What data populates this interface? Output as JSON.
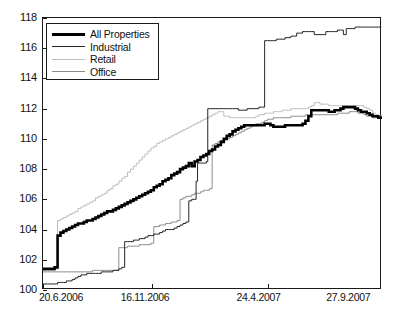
{
  "chart_data": {
    "type": "line",
    "title": "",
    "xlabel": "",
    "ylabel": "",
    "xlim": [
      0,
      465
    ],
    "ylim": [
      100,
      118
    ],
    "grid": false,
    "legend_position": "top-left",
    "y_ticks": [
      100,
      102,
      104,
      106,
      108,
      110,
      112,
      114,
      116,
      118
    ],
    "y_tick_labels": [
      "100",
      "102",
      "104",
      "106",
      "108",
      "110",
      "112",
      "114",
      "116",
      "118"
    ],
    "x_ticks": [
      0,
      149,
      308,
      464
    ],
    "x_tick_labels": [
      "20.6.2006",
      "16.11.2006",
      "24.4.2007",
      "27.9.2007"
    ],
    "series": [
      {
        "name": "All Properties",
        "color": "#000000",
        "width": 2.6,
        "x": [
          0,
          6,
          12,
          16,
          20,
          24,
          28,
          32,
          36,
          40,
          44,
          48,
          52,
          56,
          60,
          64,
          68,
          72,
          76,
          80,
          84,
          88,
          92,
          96,
          100,
          104,
          108,
          112,
          116,
          120,
          124,
          128,
          132,
          136,
          140,
          144,
          148,
          152,
          156,
          160,
          164,
          168,
          172,
          176,
          180,
          184,
          188,
          192,
          196,
          200,
          204,
          208,
          212,
          216,
          220,
          224,
          228,
          232,
          236,
          240,
          244,
          248,
          252,
          256,
          260,
          264,
          268,
          272,
          276,
          280,
          284,
          288,
          292,
          296,
          300,
          304,
          308,
          312,
          316,
          320,
          324,
          328,
          332,
          336,
          340,
          344,
          348,
          352,
          356,
          360,
          364,
          368,
          372,
          376,
          380,
          384,
          388,
          392,
          396,
          400,
          404,
          408,
          412,
          416,
          420,
          424,
          428,
          432,
          436,
          440,
          444,
          448,
          452,
          456,
          460,
          464
        ],
        "y": [
          101.4,
          101.4,
          101.4,
          101.5,
          103.6,
          103.8,
          103.9,
          104.0,
          104.1,
          104.2,
          104.3,
          104.4,
          104.4,
          104.5,
          104.6,
          104.6,
          104.7,
          104.8,
          104.9,
          105.0,
          105.1,
          105.2,
          105.2,
          105.3,
          105.4,
          105.5,
          105.6,
          105.7,
          105.8,
          105.9,
          106.0,
          106.1,
          106.2,
          106.3,
          106.4,
          106.5,
          106.6,
          106.8,
          106.9,
          107.0,
          107.2,
          107.3,
          107.4,
          107.6,
          107.7,
          107.8,
          108.0,
          108.1,
          108.2,
          108.4,
          108.2,
          108.5,
          108.6,
          108.8,
          108.9,
          109.0,
          109.2,
          109.3,
          109.5,
          109.6,
          109.8,
          110.0,
          110.2,
          110.3,
          110.5,
          110.6,
          110.7,
          110.8,
          110.9,
          110.9,
          110.9,
          110.9,
          110.9,
          110.9,
          110.9,
          111.0,
          111.0,
          110.9,
          110.8,
          110.8,
          110.8,
          110.8,
          110.9,
          110.9,
          110.9,
          110.9,
          110.9,
          110.9,
          111.0,
          111.2,
          111.5,
          111.9,
          111.9,
          111.9,
          111.9,
          111.9,
          111.9,
          111.8,
          111.8,
          111.9,
          111.9,
          112.0,
          112.1,
          112.1,
          112.1,
          112.1,
          112.0,
          111.9,
          111.8,
          111.8,
          111.7,
          111.6,
          111.5,
          111.5,
          111.4,
          111.5
        ]
      },
      {
        "name": "Industrial",
        "color": "#262626",
        "width": 1.0,
        "x": [
          0,
          6,
          12,
          16,
          20,
          24,
          28,
          32,
          36,
          40,
          44,
          48,
          52,
          56,
          60,
          64,
          68,
          72,
          76,
          80,
          84,
          88,
          92,
          96,
          100,
          104,
          108,
          112,
          116,
          120,
          124,
          128,
          132,
          136,
          140,
          144,
          148,
          152,
          156,
          160,
          164,
          168,
          172,
          176,
          180,
          184,
          188,
          192,
          196,
          200,
          204,
          208,
          210,
          212,
          216,
          220,
          224,
          226,
          228,
          232,
          236,
          240,
          244,
          248,
          252,
          256,
          260,
          264,
          268,
          272,
          276,
          280,
          284,
          288,
          292,
          296,
          300,
          304,
          308,
          312,
          316,
          320,
          324,
          328,
          332,
          336,
          340,
          344,
          348,
          352,
          356,
          360,
          364,
          368,
          372,
          376,
          380,
          384,
          388,
          392,
          396,
          400,
          404,
          408,
          412,
          416,
          420,
          424,
          428,
          432,
          436,
          440,
          444,
          448,
          452,
          456,
          460,
          464
        ],
        "y": [
          100.4,
          100.4,
          100.4,
          100.4,
          100.5,
          100.5,
          100.5,
          100.6,
          100.6,
          100.7,
          100.8,
          100.9,
          101.0,
          101.0,
          101.1,
          101.1,
          101.1,
          101.1,
          101.1,
          101.2,
          101.2,
          101.2,
          101.2,
          101.3,
          101.3,
          101.4,
          101.5,
          103.2,
          103.2,
          103.2,
          103.3,
          103.3,
          103.4,
          103.4,
          103.5,
          103.6,
          103.6,
          103.7,
          103.7,
          103.8,
          103.9,
          104.0,
          104.0,
          104.0,
          104.1,
          104.2,
          104.3,
          104.4,
          104.5,
          105.9,
          106.0,
          106.0,
          107.2,
          108.4,
          108.4,
          108.4,
          108.5,
          112.0,
          112.0,
          112.0,
          112.0,
          112.0,
          112.0,
          112.0,
          112.0,
          112.0,
          112.0,
          112.0,
          111.9,
          111.9,
          111.9,
          112.0,
          112.0,
          112.0,
          112.0,
          112.1,
          112.1,
          116.5,
          116.5,
          116.5,
          116.5,
          116.6,
          116.6,
          116.6,
          116.7,
          116.7,
          116.8,
          116.8,
          117.0,
          117.0,
          117.1,
          117.1,
          117.1,
          117.1,
          116.9,
          116.9,
          116.9,
          116.9,
          117.1,
          117.1,
          117.1,
          117.1,
          117.2,
          117.2,
          116.9,
          117.3,
          117.3,
          117.3,
          117.4,
          117.4,
          117.4,
          117.4,
          117.4,
          117.4,
          117.4,
          117.4,
          117.4,
          117.4
        ]
      },
      {
        "name": "Retail",
        "color": "#bdbdbd",
        "width": 1.0,
        "x": [
          0,
          6,
          12,
          16,
          20,
          24,
          28,
          32,
          36,
          40,
          44,
          48,
          52,
          56,
          60,
          64,
          68,
          72,
          76,
          80,
          84,
          88,
          92,
          96,
          100,
          104,
          108,
          112,
          116,
          120,
          124,
          128,
          132,
          136,
          140,
          144,
          148,
          152,
          156,
          160,
          164,
          168,
          172,
          176,
          180,
          184,
          188,
          192,
          196,
          200,
          204,
          208,
          212,
          216,
          220,
          224,
          228,
          232,
          236,
          240,
          244,
          248,
          252,
          256,
          260,
          264,
          268,
          272,
          276,
          280,
          284,
          288,
          292,
          296,
          300,
          304,
          308,
          312,
          316,
          320,
          324,
          328,
          332,
          336,
          340,
          344,
          348,
          352,
          356,
          360,
          364,
          368,
          372,
          376,
          380,
          384,
          388,
          392,
          396,
          400,
          404,
          408,
          412,
          416,
          420,
          424,
          428,
          432,
          436,
          440,
          444,
          448,
          452,
          456,
          460,
          464
        ],
        "y": [
          101.3,
          101.3,
          101.3,
          101.4,
          104.6,
          104.7,
          104.8,
          104.9,
          105.0,
          105.1,
          105.2,
          105.4,
          105.5,
          105.6,
          105.7,
          105.8,
          105.9,
          106.1,
          106.2,
          106.3,
          106.4,
          106.6,
          106.7,
          106.9,
          107.0,
          107.2,
          107.4,
          107.5,
          107.8,
          108.0,
          108.2,
          108.4,
          108.6,
          108.8,
          109.0,
          109.2,
          109.4,
          109.5,
          109.7,
          109.8,
          109.9,
          110.0,
          110.1,
          110.2,
          110.3,
          110.4,
          110.5,
          110.6,
          110.7,
          110.8,
          110.9,
          111.0,
          111.1,
          111.2,
          111.3,
          111.4,
          111.5,
          111.6,
          111.7,
          111.8,
          111.8,
          111.5,
          111.5,
          111.4,
          111.4,
          111.4,
          111.4,
          111.4,
          111.4,
          111.4,
          111.4,
          111.4,
          111.5,
          111.6,
          111.6,
          111.7,
          111.7,
          111.7,
          111.8,
          111.8,
          111.8,
          111.9,
          111.9,
          111.9,
          112.0,
          112.0,
          112.0,
          112.0,
          112.0,
          112.0,
          112.1,
          112.2,
          112.4,
          112.4,
          112.3,
          112.3,
          112.3,
          112.2,
          112.2,
          112.2,
          112.2,
          112.2,
          112.2,
          112.2,
          112.2,
          112.2,
          112.2,
          112.2,
          112.2,
          112.1,
          112.0,
          111.9,
          111.7,
          111.6,
          111.5,
          111.6
        ]
      },
      {
        "name": "Office",
        "color": "#8c8c8c",
        "width": 1.0,
        "x": [
          0,
          6,
          12,
          16,
          20,
          24,
          28,
          32,
          36,
          40,
          44,
          48,
          52,
          56,
          60,
          64,
          68,
          72,
          76,
          80,
          84,
          88,
          92,
          96,
          100,
          104,
          108,
          112,
          116,
          120,
          124,
          128,
          132,
          136,
          140,
          144,
          148,
          152,
          156,
          160,
          164,
          168,
          172,
          176,
          180,
          184,
          188,
          192,
          196,
          200,
          204,
          208,
          212,
          216,
          220,
          224,
          228,
          232,
          236,
          240,
          244,
          248,
          252,
          256,
          260,
          264,
          268,
          272,
          276,
          280,
          284,
          288,
          292,
          296,
          300,
          304,
          308,
          312,
          316,
          320,
          324,
          328,
          332,
          336,
          340,
          344,
          348,
          352,
          356,
          360,
          364,
          368,
          372,
          376,
          380,
          384,
          388,
          392,
          396,
          400,
          404,
          408,
          412,
          416,
          420,
          424,
          428,
          432,
          436,
          440,
          444,
          448,
          452,
          456,
          460,
          464
        ],
        "y": [
          101.2,
          101.2,
          101.2,
          101.2,
          101.2,
          101.2,
          101.2,
          101.2,
          101.2,
          101.2,
          101.2,
          101.2,
          101.2,
          101.2,
          101.2,
          101.2,
          101.3,
          101.3,
          101.3,
          101.3,
          101.3,
          101.3,
          101.3,
          101.3,
          101.3,
          102.8,
          102.8,
          102.8,
          102.9,
          102.9,
          102.9,
          102.9,
          103.0,
          103.0,
          103.0,
          103.0,
          103.1,
          104.2,
          104.2,
          104.3,
          104.3,
          104.4,
          104.4,
          104.5,
          104.5,
          104.6,
          106.0,
          106.1,
          106.2,
          106.2,
          106.3,
          106.4,
          106.4,
          106.5,
          106.6,
          106.6,
          106.7,
          109.6,
          109.7,
          109.8,
          109.9,
          110.0,
          110.0,
          110.1,
          110.2,
          110.3,
          110.4,
          110.5,
          110.6,
          110.7,
          110.8,
          110.9,
          111.0,
          111.0,
          111.1,
          111.2,
          111.3,
          111.3,
          111.4,
          111.4,
          111.4,
          111.4,
          111.4,
          111.4,
          111.5,
          111.5,
          111.5,
          111.5,
          111.5,
          111.6,
          111.6,
          111.6,
          111.6,
          111.6,
          111.6,
          111.6,
          111.6,
          111.6,
          111.6,
          111.6,
          111.7,
          111.7,
          111.7,
          111.7,
          111.8,
          111.8,
          111.8,
          111.7,
          111.7,
          111.6,
          111.5,
          111.5,
          111.4,
          111.4,
          111.4,
          111.5
        ]
      }
    ]
  }
}
